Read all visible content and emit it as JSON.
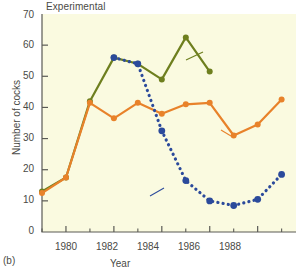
{
  "chart_data": {
    "type": "line",
    "title": "Experimental",
    "xlabel": "Year",
    "ylabel": "Number of cocks",
    "panel_label": "(b)",
    "xlim": [
      1979,
      1989.6
    ],
    "ylim": [
      0,
      70
    ],
    "grid": false,
    "legend_position": "inline-annotations",
    "x_ticks_major": [
      1980,
      1982,
      1984,
      1986,
      1988
    ],
    "x_ticks_minor": [
      1979,
      1981,
      1983,
      1985,
      1987,
      1989
    ],
    "x_tick_labels": [
      "1980",
      "1982",
      "1984",
      "1986",
      "1988"
    ],
    "y_ticks": [
      0,
      10,
      20,
      30,
      40,
      50,
      60,
      70
    ],
    "y_tick_labels": [
      "0",
      "10",
      "20",
      "30",
      "40",
      "50",
      "60",
      "70"
    ],
    "plot_background": "#FAFAE0",
    "series": [
      {
        "name": "Population before removal",
        "color": "#6E7F1E",
        "style": "solid-with-markers",
        "x": [
          1979,
          1980,
          1981,
          1982,
          1983,
          1984,
          1985,
          1986
        ],
        "values": [
          13,
          17.5,
          42,
          56,
          54,
          49,
          62.5,
          51.5
        ]
      },
      {
        "name": "Population after removal",
        "color": "#E8822A",
        "style": "solid-with-markers",
        "x": [
          1979,
          1980,
          1981,
          1982,
          1983,
          1984,
          1985,
          1986,
          1987,
          1988,
          1989
        ],
        "values": [
          12.5,
          17.5,
          41.5,
          36.5,
          41.5,
          38,
          41,
          41.5,
          31,
          34.5,
          42.5
        ]
      },
      {
        "name": "Predicted by model",
        "color": "#2B4A9B",
        "style": "dotted-with-markers",
        "x": [
          1982,
          1983,
          1984,
          1985,
          1986,
          1987,
          1988,
          1989
        ],
        "values": [
          56,
          54,
          32.5,
          16.5,
          10,
          8.5,
          10.5,
          18.5
        ]
      }
    ],
    "annotations": [
      {
        "id": "before",
        "text": "Population\nbefore removal",
        "color": "#4a4a46"
      },
      {
        "id": "after",
        "text": "Population\nafter\nremoval",
        "color": "#4a4a46"
      },
      {
        "id": "predicted",
        "text": "Predicted\nby model",
        "color": "#4a4a46"
      }
    ]
  },
  "labels": {
    "title": "Experimental",
    "ylabel": "Number of cocks",
    "xlabel": "Year",
    "panel": "(b)",
    "ann_before": "Population\nbefore removal",
    "ann_after": "Population\nafter\nremoval",
    "ann_pred": "Predicted\nby model",
    "y0": "0",
    "y10": "10",
    "y20": "20",
    "y30": "30",
    "y40": "40",
    "y50": "50",
    "y60": "60",
    "y70": "70",
    "x1980": "1980",
    "x1982": "1982",
    "x1984": "1984",
    "x1986": "1986",
    "x1988": "1988"
  }
}
